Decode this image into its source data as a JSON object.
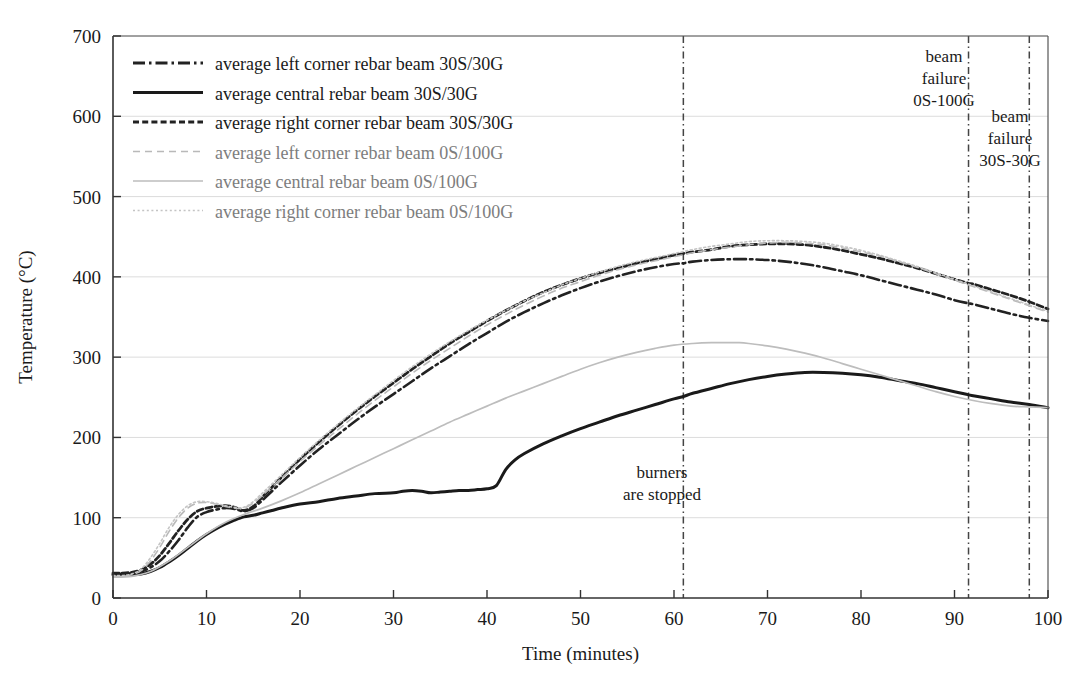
{
  "chart_data": {
    "type": "line",
    "title": "",
    "xlabel": "Time (minutes)",
    "ylabel": "Temperature (°C)",
    "xlim": [
      0,
      100
    ],
    "ylim": [
      0,
      700
    ],
    "xticks": [
      0,
      10,
      20,
      30,
      40,
      50,
      60,
      70,
      80,
      90,
      100
    ],
    "yticks": [
      0,
      100,
      200,
      300,
      400,
      500,
      600,
      700
    ],
    "grid": true,
    "legend_position": "top-left",
    "series": [
      {
        "name": "average left corner rebar beam 30S/30G",
        "style": "dash-dot",
        "color": "#222222",
        "width": 2.6,
        "x": [
          0,
          1,
          2,
          3,
          4,
          5,
          6,
          7,
          8,
          9,
          10,
          11,
          12,
          13,
          14,
          15,
          16,
          17,
          18,
          20,
          22,
          24,
          26,
          28,
          30,
          32,
          34,
          36,
          38,
          40,
          42,
          44,
          46,
          48,
          50,
          52,
          54,
          56,
          58,
          60,
          61,
          62,
          64,
          66,
          68,
          70,
          72,
          74,
          76,
          78,
          80,
          82,
          84,
          86,
          88,
          90,
          91.5,
          92,
          94,
          96,
          98,
          100
        ],
        "y": [
          30,
          30,
          31,
          33,
          38,
          46,
          58,
          72,
          88,
          101,
          107,
          110,
          112,
          111,
          108,
          112,
          122,
          133,
          144,
          165,
          185,
          203,
          221,
          238,
          254,
          270,
          286,
          301,
          316,
          330,
          344,
          356,
          367,
          377,
          386,
          394,
          401,
          407,
          412,
          416,
          417,
          419,
          421,
          422,
          422,
          421,
          419,
          416,
          412,
          407,
          402,
          396,
          390,
          384,
          378,
          371,
          367,
          366,
          360,
          354,
          349,
          345
        ]
      },
      {
        "name": "average central rebar beam 30S/30G",
        "style": "solid",
        "color": "#1a1a1a",
        "width": 3.0,
        "x": [
          0,
          1,
          2,
          3,
          4,
          5,
          6,
          7,
          8,
          9,
          10,
          11,
          12,
          13,
          14,
          15,
          16,
          17,
          18,
          20,
          22,
          24,
          26,
          28,
          30,
          31,
          32,
          33,
          34,
          35,
          36,
          37,
          38,
          39,
          40,
          41,
          42,
          43,
          44,
          46,
          48,
          50,
          52,
          54,
          56,
          58,
          60,
          61,
          62,
          64,
          66,
          68,
          70,
          72,
          74,
          76,
          78,
          80,
          82,
          84,
          86,
          88,
          90,
          91.5,
          92,
          94,
          96,
          98,
          100
        ],
        "y": [
          29,
          29,
          29,
          30,
          33,
          38,
          45,
          53,
          62,
          71,
          79,
          86,
          92,
          97,
          101,
          103,
          106,
          109,
          112,
          117,
          120,
          124,
          127,
          130,
          131,
          133,
          134,
          133,
          131,
          132,
          133,
          134,
          134,
          135,
          136,
          140,
          160,
          172,
          180,
          192,
          202,
          211,
          219,
          227,
          234,
          241,
          248,
          251,
          255,
          261,
          267,
          272,
          276,
          279,
          281,
          281,
          280,
          278,
          275,
          271,
          267,
          262,
          257,
          253,
          252,
          248,
          244,
          241,
          237
        ]
      },
      {
        "name": "average right corner rebar beam 30S/30G",
        "style": "dashed",
        "color": "#222222",
        "width": 2.8,
        "x": [
          0,
          1,
          2,
          3,
          4,
          5,
          6,
          7,
          8,
          9,
          10,
          11,
          12,
          13,
          14,
          15,
          16,
          17,
          18,
          20,
          22,
          24,
          26,
          28,
          30,
          32,
          34,
          36,
          38,
          40,
          42,
          44,
          46,
          48,
          50,
          52,
          54,
          56,
          58,
          60,
          61,
          62,
          64,
          66,
          68,
          70,
          72,
          74,
          76,
          78,
          80,
          82,
          84,
          86,
          88,
          90,
          91.5,
          92,
          94,
          96,
          98,
          100
        ],
        "y": [
          31,
          31,
          32,
          35,
          42,
          53,
          68,
          84,
          98,
          108,
          112,
          114,
          115,
          113,
          109,
          114,
          126,
          138,
          150,
          173,
          194,
          214,
          233,
          251,
          268,
          285,
          301,
          317,
          331,
          345,
          358,
          370,
          381,
          390,
          398,
          405,
          411,
          417,
          422,
          427,
          429,
          431,
          434,
          438,
          440,
          441,
          441,
          440,
          437,
          433,
          428,
          423,
          417,
          411,
          404,
          397,
          392,
          391,
          384,
          377,
          369,
          360
        ]
      },
      {
        "name": "average left corner rebar beam 0S/100G",
        "style": "dashed-light",
        "color": "#b9b9b9",
        "width": 1.6,
        "x": [
          0,
          1,
          2,
          3,
          4,
          5,
          6,
          7,
          8,
          9,
          10,
          11,
          12,
          13,
          14,
          15,
          16,
          18,
          20,
          22,
          24,
          26,
          28,
          30,
          32,
          34,
          36,
          38,
          40,
          42,
          44,
          46,
          48,
          50,
          52,
          54,
          56,
          58,
          60,
          62,
          64,
          66,
          68,
          70,
          72,
          74,
          76,
          78,
          80,
          82,
          84,
          86,
          88,
          90,
          92,
          94,
          96,
          98,
          100
        ],
        "y": [
          27,
          27,
          29,
          34,
          46,
          63,
          83,
          100,
          112,
          118,
          119,
          117,
          114,
          112,
          112,
          118,
          128,
          149,
          170,
          190,
          209,
          228,
          246,
          263,
          280,
          296,
          311,
          326,
          340,
          353,
          365,
          376,
          386,
          394,
          402,
          409,
          415,
          420,
          425,
          430,
          434,
          437,
          440,
          442,
          443,
          442,
          440,
          436,
          431,
          426,
          419,
          412,
          404,
          396,
          388,
          380,
          372,
          364,
          356
        ]
      },
      {
        "name": "average central rebar beam 0S/100G",
        "style": "solid-light",
        "color": "#bdbdbd",
        "width": 1.7,
        "x": [
          0,
          2,
          4,
          6,
          8,
          10,
          12,
          14,
          16,
          18,
          20,
          22,
          24,
          26,
          28,
          30,
          32,
          34,
          36,
          38,
          40,
          42,
          44,
          46,
          48,
          50,
          52,
          54,
          56,
          58,
          60,
          62,
          64,
          66,
          67,
          68,
          70,
          72,
          74,
          76,
          78,
          80,
          82,
          84,
          86,
          88,
          90,
          92,
          94,
          96,
          98,
          100
        ],
        "y": [
          26,
          27,
          33,
          46,
          63,
          80,
          94,
          104,
          112,
          121,
          131,
          142,
          153,
          164,
          175,
          186,
          197,
          208,
          219,
          229,
          239,
          249,
          258,
          267,
          276,
          285,
          293,
          300,
          306,
          311,
          315,
          317,
          318,
          318,
          318,
          317,
          314,
          310,
          305,
          299,
          292,
          285,
          278,
          271,
          264,
          257,
          251,
          246,
          242,
          239,
          238,
          237
        ]
      },
      {
        "name": "average right corner rebar beam 0S/100G",
        "style": "dotted-light",
        "color": "#c4c4c4",
        "width": 1.6,
        "x": [
          0,
          1,
          2,
          3,
          4,
          5,
          6,
          7,
          8,
          9,
          10,
          11,
          12,
          13,
          14,
          15,
          16,
          18,
          20,
          22,
          24,
          26,
          28,
          30,
          32,
          34,
          36,
          38,
          40,
          42,
          44,
          46,
          48,
          50,
          52,
          54,
          56,
          58,
          60,
          62,
          64,
          66,
          68,
          70,
          72,
          74,
          76,
          78,
          80,
          82,
          84,
          86,
          88,
          90,
          92,
          94,
          96,
          98,
          100
        ],
        "y": [
          28,
          28,
          30,
          36,
          50,
          68,
          88,
          104,
          115,
          120,
          120,
          118,
          115,
          113,
          113,
          120,
          131,
          153,
          175,
          196,
          216,
          235,
          253,
          271,
          288,
          304,
          319,
          333,
          346,
          358,
          370,
          380,
          390,
          398,
          406,
          413,
          419,
          424,
          429,
          434,
          438,
          441,
          444,
          445,
          445,
          444,
          442,
          438,
          433,
          427,
          420,
          413,
          405,
          397,
          389,
          381,
          373,
          365,
          357
        ]
      }
    ],
    "annotations": [
      {
        "id": "burners-stopped",
        "lines": [
          "burners",
          "are stopped"
        ],
        "x": 61,
        "marker_line": true
      },
      {
        "id": "beam-failure-0s100g",
        "lines": [
          "beam",
          "failure",
          "0S-100G"
        ],
        "x": 91.5,
        "marker_line": true
      },
      {
        "id": "beam-failure-30s30g",
        "lines": [
          "beam",
          "failure",
          "30S-30G"
        ],
        "x": 98,
        "marker_line": true
      }
    ]
  },
  "legend": {
    "items": [
      {
        "label": "average left corner rebar beam 30S/30G",
        "style": "dash-dot",
        "color": "#222222"
      },
      {
        "label": "average central rebar beam 30S/30G",
        "style": "solid",
        "color": "#1a1a1a"
      },
      {
        "label": "average right corner rebar beam 30S/30G",
        "style": "dashed",
        "color": "#222222"
      },
      {
        "label": "average left corner rebar beam 0S/100G",
        "style": "dashed-light",
        "color": "#b9b9b9"
      },
      {
        "label": "average central rebar beam 0S/100G",
        "style": "solid-light",
        "color": "#bdbdbd"
      },
      {
        "label": "average right corner rebar beam 0S/100G",
        "style": "dotted-light",
        "color": "#c4c4c4"
      }
    ]
  }
}
